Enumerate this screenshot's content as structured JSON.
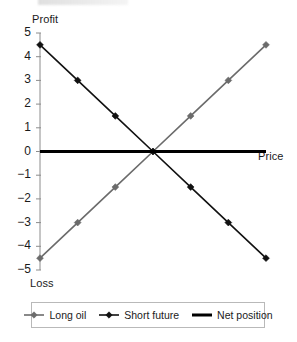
{
  "chart_data": {
    "type": "line",
    "title": "",
    "xlabel": "Price",
    "ylabel": "Profit",
    "y_secondary_label": "Loss",
    "grid": false,
    "legend_position": "bottom",
    "xlim": [
      0,
      6
    ],
    "ylim": [
      -5,
      5
    ],
    "x": [
      0,
      1,
      2,
      3,
      4,
      5,
      6
    ],
    "yticks": [
      5,
      4,
      3,
      2,
      1,
      0,
      -1,
      -2,
      -3,
      -4,
      -5
    ],
    "ytick_labels": [
      "5",
      "4",
      "3",
      "2",
      "1",
      "0",
      "−1",
      "−2",
      "−3",
      "−4",
      "−5"
    ],
    "series": [
      {
        "name": "Long oil",
        "color": "#6b6b6b",
        "marker": "diamond",
        "values": [
          -4.5,
          -3.0,
          -1.5,
          0.0,
          1.5,
          3.0,
          4.5
        ]
      },
      {
        "name": "Short future",
        "color": "#111111",
        "marker": "diamond",
        "values": [
          4.5,
          3.0,
          1.5,
          0.0,
          -1.5,
          -3.0,
          -4.5
        ]
      },
      {
        "name": "Net position",
        "color": "#000000",
        "marker": "none",
        "values": [
          0,
          0,
          0,
          0,
          0,
          0,
          0
        ]
      }
    ]
  },
  "axes": {
    "profit_label": "Profit",
    "loss_label": "Loss",
    "price_label": "Price"
  },
  "legend": {
    "entries": [
      {
        "label": "Long oil",
        "color": "#6b6b6b",
        "marker": "diamond"
      },
      {
        "label": "Short future",
        "color": "#111111",
        "marker": "diamond"
      },
      {
        "label": "Net position",
        "color": "#000000",
        "marker": "none"
      }
    ]
  },
  "colors": {
    "long_oil": "#6b6b6b",
    "short_future": "#111111",
    "net_position": "#000000",
    "axis": "#8c8c8c",
    "background": "#ffffff"
  }
}
